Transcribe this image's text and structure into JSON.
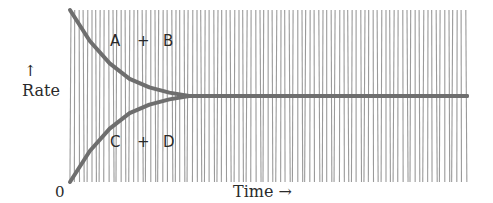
{
  "chart_data": {
    "type": "line",
    "title": "",
    "xlabel": "Time →",
    "ylabel": "Rate",
    "ylabel_arrow": "↑",
    "origin_label": "0",
    "xlim": [
      0,
      1
    ],
    "ylim": [
      0,
      1
    ],
    "grid": false,
    "background": "vertical-hatching",
    "series": [
      {
        "name": "forward",
        "label": "A + B",
        "label_parts": [
          "A",
          "+",
          "B"
        ],
        "description": "forward reaction rate decreasing to equilibrium",
        "x": [
          0,
          0.05,
          0.1,
          0.15,
          0.2,
          0.25,
          0.3,
          1.0
        ],
        "y": [
          1.0,
          0.82,
          0.69,
          0.6,
          0.55,
          0.52,
          0.5,
          0.5
        ]
      },
      {
        "name": "reverse",
        "label": "C + D",
        "label_parts": [
          "C",
          "+",
          "D"
        ],
        "description": "reverse reaction rate increasing to equilibrium",
        "x": [
          0,
          0.05,
          0.1,
          0.15,
          0.2,
          0.25,
          0.3,
          1.0
        ],
        "y": [
          0.0,
          0.18,
          0.31,
          0.4,
          0.45,
          0.48,
          0.5,
          0.5
        ]
      }
    ],
    "colors": {
      "curve": "#6e6e6e",
      "hatch": "#9a9a9a",
      "text": "#2a2a2a"
    }
  }
}
